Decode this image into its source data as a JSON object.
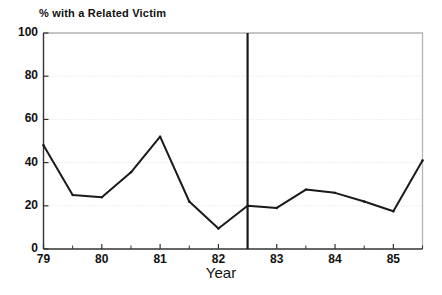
{
  "chart_data": {
    "type": "line",
    "title": "% with a Related Victim",
    "xlabel": "Year",
    "ylabel": "",
    "xlim": [
      79,
      85.5
    ],
    "ylim": [
      0,
      100
    ],
    "grid": true,
    "legend": "none",
    "y_ticks": [
      0,
      20,
      40,
      60,
      80,
      100
    ],
    "y_tick_labels": [
      "0",
      "20",
      "40",
      "60",
      "80",
      "100"
    ],
    "x_ticks": [
      79,
      80,
      81,
      82,
      83,
      84,
      85
    ],
    "x_tick_labels": [
      "79",
      "80",
      "81",
      "82",
      "83",
      "84",
      "85"
    ],
    "x_minor_ticks": [
      79.5,
      80.5,
      81.5,
      82.5,
      83.5,
      84.5,
      85.5
    ],
    "x": [
      79,
      79.5,
      80,
      80.5,
      81,
      81.5,
      82,
      82.5,
      83,
      83.5,
      84,
      84.5,
      85,
      85.5
    ],
    "values": [
      48,
      25,
      24,
      35.5,
      52,
      22,
      9.5,
      20,
      19,
      27.5,
      26,
      22,
      17.5,
      41
    ],
    "series": [
      {
        "name": "% with a Related Victim",
        "values": [
          48,
          25,
          24,
          35.5,
          52,
          22,
          9.5,
          20,
          19,
          27.5,
          26,
          22,
          17.5,
          41
        ]
      }
    ],
    "annotations": [
      {
        "type": "vline",
        "x": 82.5,
        "label": ""
      }
    ],
    "colors": {
      "line": "#1a1a1a",
      "frame": "#b5b5b5",
      "grid": "#dddddd",
      "vline": "#1a1a1a",
      "background": "#ffffff"
    }
  }
}
